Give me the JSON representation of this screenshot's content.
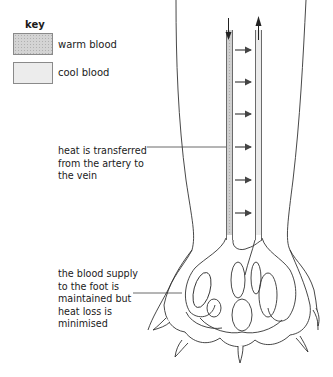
{
  "key": {
    "title": "key",
    "items": [
      {
        "label": "warm blood",
        "color": "#d4d4d4",
        "pattern": "stippled"
      },
      {
        "label": "cool blood",
        "color": "#ececec",
        "pattern": "plain"
      }
    ]
  },
  "annotations": [
    {
      "id": "heat-transfer",
      "text": "heat is transferred\nfrom the artery to\nthe vein"
    },
    {
      "id": "blood-supply",
      "text": "the blood supply\nto the foot is\nmaintained but\nheat loss is\nminimised"
    }
  ],
  "diagram": {
    "vessels": [
      {
        "name": "artery",
        "flow": "down",
        "blood": "warm blood"
      },
      {
        "name": "vein",
        "flow": "up",
        "blood": "cool blood"
      }
    ],
    "heat_transfer_arrows": 6,
    "arrow_direction": "artery-to-vein"
  }
}
